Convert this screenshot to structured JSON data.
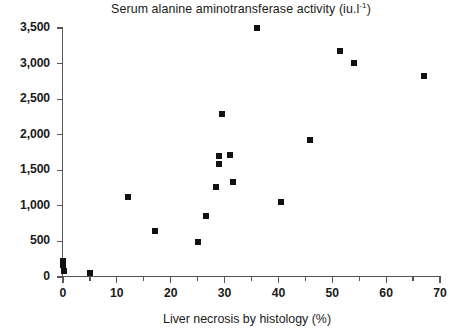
{
  "chart_data": {
    "type": "scatter",
    "title": "Serum alanine aminotransferase activity (iu.l-1)",
    "title_main": "Serum alanine aminotransferase activity (iu.l",
    "title_sup": "-1",
    "title_tail": ")",
    "xlabel": "Liver necrosis by histology (%)",
    "ylabel": "",
    "xlim": [
      0,
      70
    ],
    "ylim": [
      0,
      3500
    ],
    "xticks": [
      0,
      10,
      20,
      30,
      40,
      50,
      60,
      70
    ],
    "xtick_labels": [
      "0",
      "10",
      "20",
      "30",
      "40",
      "50",
      "60",
      "70"
    ],
    "yticks": [
      0,
      500,
      1000,
      1500,
      2000,
      2500,
      3000,
      3500
    ],
    "ytick_labels": [
      "0",
      "500",
      "1,000",
      "1,500",
      "2,000",
      "2,500",
      "3,000",
      "3,500"
    ],
    "x_minor_tick_step": 5,
    "grid": false,
    "legend": null,
    "marker": "square",
    "marker_color": "#111111",
    "axis_color": "#555555",
    "series": [
      {
        "name": "patients",
        "points": [
          {
            "x": 0.0,
            "y": 230
          },
          {
            "x": 0.0,
            "y": 170
          },
          {
            "x": 0.2,
            "y": 90
          },
          {
            "x": 5.0,
            "y": 60
          },
          {
            "x": 12.0,
            "y": 1130
          },
          {
            "x": 17.0,
            "y": 650
          },
          {
            "x": 25.0,
            "y": 490
          },
          {
            "x": 26.5,
            "y": 860
          },
          {
            "x": 28.5,
            "y": 1270
          },
          {
            "x": 29.0,
            "y": 1700
          },
          {
            "x": 29.0,
            "y": 1590
          },
          {
            "x": 29.5,
            "y": 2290
          },
          {
            "x": 31.0,
            "y": 1710
          },
          {
            "x": 31.5,
            "y": 1340
          },
          {
            "x": 36.0,
            "y": 3500
          },
          {
            "x": 40.5,
            "y": 1060
          },
          {
            "x": 45.8,
            "y": 1930
          },
          {
            "x": 51.5,
            "y": 3170
          },
          {
            "x": 54.0,
            "y": 3010
          },
          {
            "x": 67.0,
            "y": 2820
          }
        ]
      }
    ]
  }
}
